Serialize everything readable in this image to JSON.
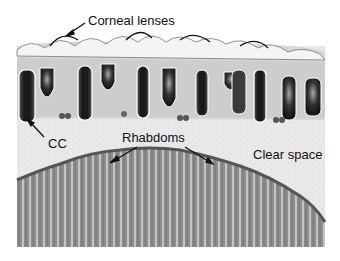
{
  "figure": {
    "type": "micrograph",
    "labels": {
      "corneal_lenses": "Corneal lenses",
      "cc": "CC",
      "rhabdoms": "Rhabdoms",
      "clear_space": "Clear space"
    }
  }
}
